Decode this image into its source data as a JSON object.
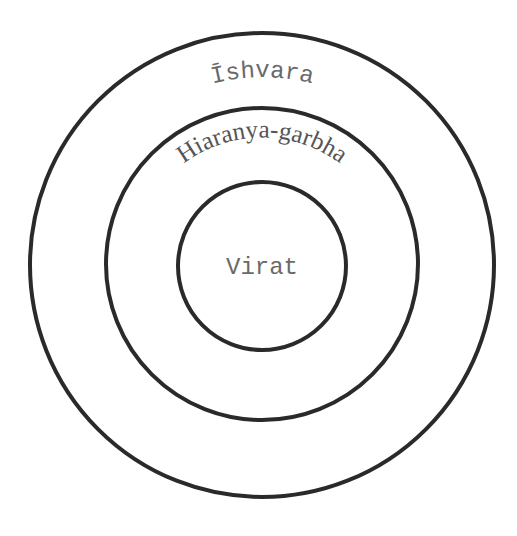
{
  "diagram": {
    "type": "concentric-circles",
    "rings": [
      {
        "name": "outer",
        "label": "Īshvara"
      },
      {
        "name": "middle",
        "label": "Hiaranya-garbha"
      },
      {
        "name": "inner",
        "label": "Virat"
      }
    ],
    "colors": {
      "stroke": "#2a2a2a",
      "text": "#6a6a6a",
      "background": "#ffffff"
    }
  }
}
